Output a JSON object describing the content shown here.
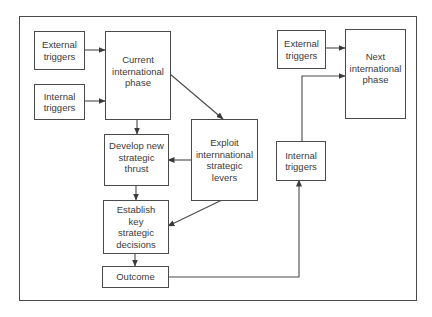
{
  "diagram": {
    "title": "",
    "nodes": {
      "external_triggers_left": {
        "label": "External\ntriggers"
      },
      "internal_triggers_left": {
        "label": "Internal\ntriggers"
      },
      "current_phase": {
        "label": "Current\ninternational\nphase"
      },
      "develop_thrust": {
        "label": "Develop new\nstrategic\nthrust"
      },
      "exploit_levers": {
        "label": "Exploit\ninternnational\nstrategic\nlevers"
      },
      "establish_decisions": {
        "label": "Establish\nkey\nstrategic\ndecisions"
      },
      "outcome": {
        "label": "Outcome"
      },
      "internal_triggers_right": {
        "label": "Internal\ntriggers"
      },
      "external_triggers_right": {
        "label": "External\ntriggers"
      },
      "next_phase": {
        "label": "Next\ninternational\nphase"
      }
    },
    "edges": [
      {
        "from": "external_triggers_left",
        "to": "current_phase"
      },
      {
        "from": "internal_triggers_left",
        "to": "current_phase"
      },
      {
        "from": "current_phase",
        "to": "develop_thrust"
      },
      {
        "from": "current_phase",
        "to": "exploit_levers"
      },
      {
        "from": "exploit_levers",
        "to": "develop_thrust"
      },
      {
        "from": "develop_thrust",
        "to": "establish_decisions"
      },
      {
        "from": "exploit_levers",
        "to": "establish_decisions"
      },
      {
        "from": "establish_decisions",
        "to": "outcome"
      },
      {
        "from": "outcome",
        "to": "internal_triggers_right"
      },
      {
        "from": "internal_triggers_right",
        "to": "next_phase"
      },
      {
        "from": "external_triggers_right",
        "to": "next_phase"
      }
    ],
    "colors": {
      "line": "#4a4a4a",
      "text": "#3a3a3a",
      "background": "#ffffff"
    }
  }
}
